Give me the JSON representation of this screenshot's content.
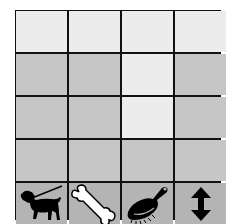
{
  "board": {
    "rows": 4,
    "cols": 4,
    "cells": [
      [
        "light",
        "light",
        "light",
        "light"
      ],
      [
        "dark",
        "dark",
        "light",
        "dark"
      ],
      [
        "dark",
        "dark",
        "light",
        "dark"
      ],
      [
        "dark",
        "dark",
        "dark",
        "dark"
      ]
    ],
    "colors": {
      "light": "#ececec",
      "dark": "#c6c6c6",
      "tool": "#b4b4b4",
      "grid": "#111111"
    }
  },
  "toolbar": {
    "items": [
      {
        "icon": "dog-on-leash-icon"
      },
      {
        "icon": "bone-icon"
      },
      {
        "icon": "brush-icon"
      },
      {
        "icon": "up-down-arrow-icon"
      }
    ]
  }
}
